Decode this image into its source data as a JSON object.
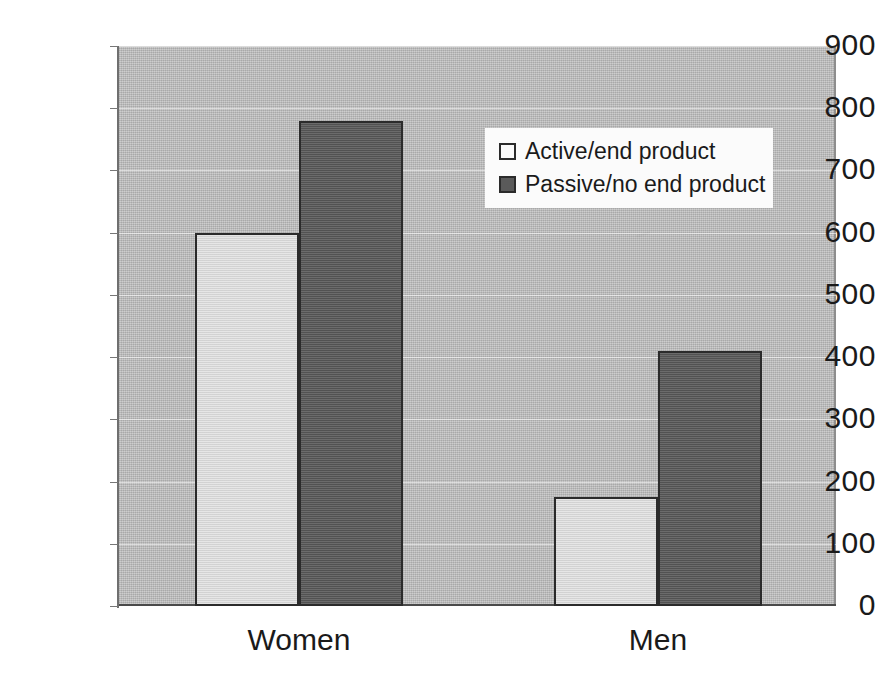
{
  "chart_data": {
    "type": "bar",
    "title": "",
    "subtitle": "",
    "xlabel": "",
    "ylabel": "",
    "categories": [
      "Women",
      "Men"
    ],
    "series": [
      {
        "name": "Active/end product",
        "values": [
          600,
          175
        ],
        "color": "#d9d9d9"
      },
      {
        "name": "Passive/no end product",
        "values": [
          780,
          410
        ],
        "color": "#5a5a5a"
      }
    ],
    "ylim": [
      0,
      900
    ],
    "ytick_step": 100,
    "ytick_labels": [
      "900",
      "800",
      "700",
      "600",
      "500",
      "400",
      "300",
      "200",
      "100",
      "0"
    ],
    "ytick_values": [
      900,
      800,
      700,
      600,
      500,
      400,
      300,
      200,
      100,
      0
    ],
    "grid": true,
    "grid_axis": "y",
    "legend_position": "upper-center-right",
    "plot_background": "#b9b9b9",
    "figure_background": "#ffffff",
    "bar_outline_color": "#2b2b2b"
  },
  "legend": {
    "items": [
      {
        "label": "Active/end product",
        "swatch": "light"
      },
      {
        "label": "Passive/no end product",
        "swatch": "dark"
      }
    ]
  }
}
